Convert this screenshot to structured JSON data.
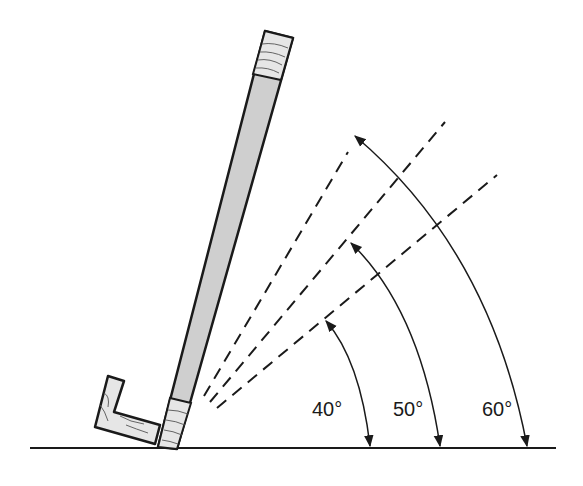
{
  "diagram": {
    "angles": [
      {
        "label": "40°",
        "value": 40
      },
      {
        "label": "50°",
        "value": 50
      },
      {
        "label": "60°",
        "value": 60
      }
    ],
    "colors": {
      "line": "#1a1a1a",
      "board_fill": "#cfcfcf",
      "wood_fill": "#e6e6e6",
      "background": "#ffffff"
    }
  }
}
